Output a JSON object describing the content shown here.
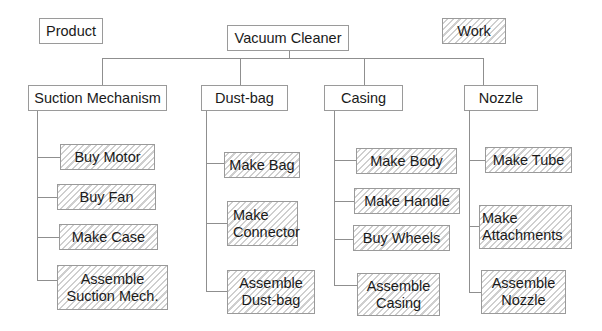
{
  "legend": {
    "product_label": "Product",
    "work_label": "Work"
  },
  "root": {
    "label": "Vacuum Cleaner"
  },
  "components": [
    {
      "label": "Suction Mechanism",
      "tasks": [
        "Buy Motor",
        "Buy Fan",
        "Make Case",
        "Assemble\nSuction Mech."
      ]
    },
    {
      "label": "Dust-bag",
      "tasks": [
        "Make Bag",
        "Make\nConnector",
        "Assemble\nDust-bag"
      ]
    },
    {
      "label": "Casing",
      "tasks": [
        "Make Body",
        "Make Handle",
        "Buy Wheels",
        "Assemble\nCasing"
      ]
    },
    {
      "label": "Nozzle",
      "tasks": [
        "Make Tube",
        "Make\nAttachments",
        "Assemble\nNozzle"
      ]
    }
  ],
  "colors": {
    "border": "#9a9a9a",
    "connector": "#8f8f8f",
    "hatch": "#cfcfcf",
    "text": "#1a1a1a"
  }
}
